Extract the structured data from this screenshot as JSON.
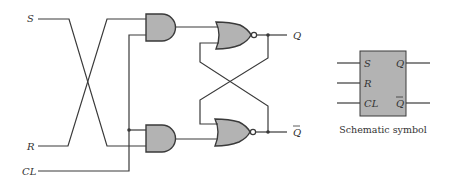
{
  "diagram": {
    "type": "clocked SR flip-flop logic diagram",
    "inputs": {
      "s_label": "S",
      "r_label": "R",
      "cl_label": "CL"
    },
    "outputs": {
      "q_label": "Q",
      "qbar_label": "Q"
    },
    "gates": [
      {
        "id": "and-top",
        "type": "AND",
        "fill": "#b3b3b3"
      },
      {
        "id": "and-bottom",
        "type": "AND",
        "fill": "#b3b3b3"
      },
      {
        "id": "nor-top",
        "type": "NOR",
        "fill": "#b3b3b3"
      },
      {
        "id": "nor-bottom",
        "type": "NOR",
        "fill": "#b3b3b3"
      }
    ],
    "symbol": {
      "caption": "Schematic symbol",
      "pin_s": "S",
      "pin_r": "R",
      "pin_cl": "CL",
      "pin_q": "Q",
      "pin_qbar": "Q",
      "fill": "#b3b3b3"
    },
    "colors": {
      "wire": "#3a3a3a",
      "gate_fill": "#b3b3b3",
      "background": "#ffffff"
    }
  }
}
